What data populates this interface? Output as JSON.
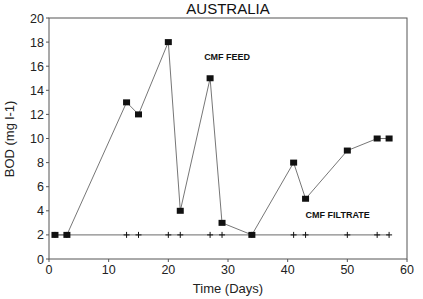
{
  "chart_data": {
    "type": "line",
    "title": "AUSTRALIA",
    "xlabel": "Time (Days)",
    "ylabel": "BOD (mg l-1)",
    "xlim": [
      0,
      60
    ],
    "ylim": [
      0,
      20
    ],
    "xticks": [
      0,
      10,
      20,
      30,
      40,
      50,
      60
    ],
    "yticks": [
      0,
      2,
      4,
      6,
      8,
      10,
      12,
      14,
      16,
      18,
      20
    ],
    "grid": false,
    "legend": "none (inline annotations)",
    "series": [
      {
        "name": "CMF FEED",
        "marker": "filled-square",
        "label_pos": {
          "x": 26,
          "y": 16.5
        },
        "x": [
          1,
          3,
          13,
          15,
          20,
          22,
          27,
          29,
          34,
          41,
          43,
          50,
          55,
          57
        ],
        "values": [
          2,
          2,
          13,
          12,
          18,
          4,
          15,
          3,
          2,
          8,
          5,
          9,
          10,
          10
        ]
      },
      {
        "name": "CMF FILTRATE",
        "marker": "plus",
        "label_pos": {
          "x": 43,
          "y": 3.4
        },
        "x": [
          1,
          3,
          13,
          15,
          20,
          22,
          27,
          29,
          34,
          41,
          43,
          50,
          55,
          57
        ],
        "values": [
          2,
          2,
          2,
          2,
          2,
          2,
          2,
          2,
          2,
          2,
          2,
          2,
          2,
          2
        ]
      }
    ]
  },
  "colors": {
    "axis": "#555555",
    "line": "#666666",
    "marker": "#111111",
    "filtrate_line": "#888888"
  }
}
